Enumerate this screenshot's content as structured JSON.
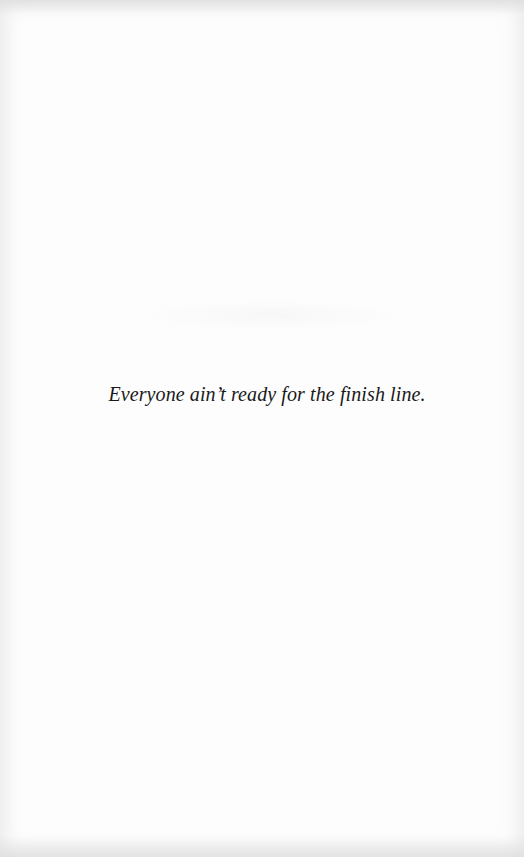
{
  "page": {
    "epigraph": "Everyone ain’t ready for the finish line."
  },
  "colors": {
    "background": "#fdfdfd",
    "text": "#1a1a1a"
  }
}
